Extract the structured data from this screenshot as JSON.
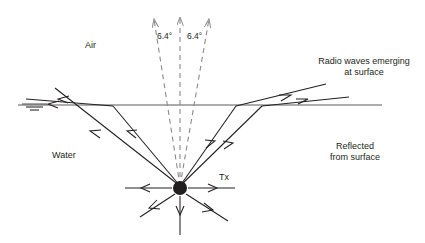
{
  "figure": {
    "type": "physics-ray-diagram",
    "title_visible": false,
    "background_color": "#ffffff",
    "ray_color": "#231f20",
    "dashed_color": "#8a8a8a",
    "surface_color": "#58595b"
  },
  "labels": {
    "air": "Air",
    "water": "Water",
    "tx": "Tx",
    "angle_left": "6.4°",
    "angle_right": "6.4°",
    "emerging_line1": "Radio waves emerging",
    "emerging_line2": "at surface",
    "reflected_line1": "Reflected",
    "reflected_line2": "from surface"
  },
  "annotations": {
    "cone_half_angle_deg": 6.4,
    "cone_total_angle_deg": 12.8,
    "transmitter_label": "Tx"
  },
  "icons": {
    "water_level": "water-level-icon",
    "transmitter": "transmitter-node-icon"
  },
  "geometry": {
    "surface_y": 105,
    "surface_x_start": 18,
    "surface_x_end": 382,
    "transmitter": {
      "x": 180,
      "y": 188,
      "r": 7
    }
  }
}
